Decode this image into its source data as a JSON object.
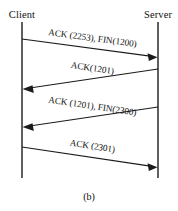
{
  "diagram": {
    "caption": "(b)",
    "colors": {
      "line": "#1a1a1a",
      "text": "#111111",
      "background": "#ffffff"
    },
    "actors": [
      {
        "id": "client",
        "label": "Client",
        "x": 22
      },
      {
        "id": "server",
        "label": "Server",
        "x": 158
      }
    ],
    "lifeline": {
      "top": 22,
      "bottom": 178
    },
    "messages": [
      {
        "index": 1,
        "label": "ACK (2253), FIN(1200)",
        "from": "client",
        "to": "server",
        "direction": "right",
        "y_start": 39,
        "y_end": 57
      },
      {
        "index": 2,
        "label": "ACK(1201)",
        "from": "server",
        "to": "client",
        "direction": "left",
        "y_start": 69,
        "y_end": 89
      },
      {
        "index": 3,
        "label": "ACK (1201), FIN(2300)",
        "from": "server",
        "to": "client",
        "direction": "left",
        "y_start": 107,
        "y_end": 127
      },
      {
        "index": 4,
        "label": "ACK (2301)",
        "from": "client",
        "to": "server",
        "direction": "right",
        "y_start": 147,
        "y_end": 167
      }
    ]
  }
}
